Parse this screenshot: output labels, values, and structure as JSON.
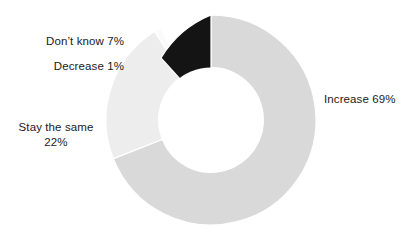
{
  "chart_data": {
    "type": "pie",
    "variant": "donut",
    "title": "",
    "subtitle": "",
    "xlabel": "",
    "ylabel": "",
    "grid": false,
    "legend_position": "callout-labels",
    "units": "percent",
    "total": 99,
    "categories": [
      "Increase",
      "Stay the same",
      "Decrease",
      "Don't know"
    ],
    "values": [
      69,
      22,
      1,
      7
    ],
    "colors": [
      "#d9d9d9",
      "#ededed",
      "#fafafa",
      "#141414"
    ],
    "start_angle_deg": 0,
    "direction": "clockwise",
    "inner_radius_ratio": 0.5,
    "slices": [
      {
        "label": "Increase",
        "value": 69,
        "value_text": "69%",
        "color": "#d9d9d9",
        "start_deg": 0,
        "end_deg": 248.4
      },
      {
        "label": "Stay the same",
        "value": 22,
        "value_text": "22%",
        "color": "#ededed",
        "start_deg": 248.4,
        "end_deg": 327.6
      },
      {
        "label": "Decrease",
        "value": 1,
        "value_text": "1%",
        "color": "#fafafa",
        "start_deg": 327.6,
        "end_deg": 331.2
      },
      {
        "label": "Don't know",
        "value": 7,
        "value_text": "7%",
        "color": "#141414",
        "start_deg": 331.2,
        "end_deg": 360
      }
    ]
  },
  "labels": {
    "increase": "Increase 69%",
    "stay_the_same_line1": "Stay the same",
    "stay_the_same_line2": "22%",
    "decrease": "Decrease 1%",
    "dont_know": "Don’t know 7%"
  },
  "style": {
    "background": "#ffffff",
    "text_color": "#1b1b1b",
    "slice_separator_color": "#ffffff"
  }
}
